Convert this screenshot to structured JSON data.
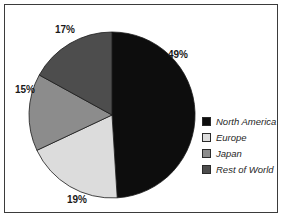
{
  "chart_data": {
    "type": "pie",
    "title": "",
    "categories": [
      "North America",
      "Europe",
      "Japan",
      "Rest of World"
    ],
    "values": [
      49,
      19,
      15,
      17
    ],
    "value_unit": "%",
    "data_labels": [
      "49%",
      "19%",
      "15%",
      "17%"
    ],
    "colors": [
      "#0d0d0d",
      "#dcdcdc",
      "#8c8c8c",
      "#4d4d4d"
    ],
    "start_angle_deg": 0,
    "direction": "clockwise",
    "legend": {
      "position": "right",
      "entries": [
        {
          "label": "North America",
          "color": "#0d0d0d"
        },
        {
          "label": "Europe",
          "color": "#dcdcdc"
        },
        {
          "label": "Japan",
          "color": "#8c8c8c"
        },
        {
          "label": "Rest of World",
          "color": "#4d4d4d"
        }
      ]
    },
    "grid": false,
    "xlabel": "",
    "ylabel": ""
  },
  "figure": {
    "border_color": "#3b3b3b",
    "background": "#ffffff"
  }
}
